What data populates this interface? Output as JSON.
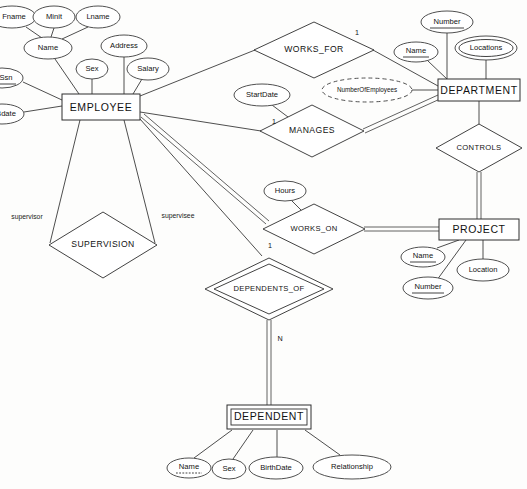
{
  "diagram": {
    "notation": "Chen",
    "background_color": "#fdfdfc",
    "line_color": "#2e2e2e",
    "text_color": "#121212"
  },
  "entities": [
    {
      "id": "employee",
      "label": "EMPLOYEE",
      "weak": false,
      "x": 101,
      "y": 107,
      "w": 78,
      "h": 26
    },
    {
      "id": "department",
      "label": "DEPARTMENT",
      "weak": false,
      "x": 479,
      "y": 90,
      "w": 82,
      "h": 22
    },
    {
      "id": "project",
      "label": "PROJECT",
      "weak": false,
      "x": 479,
      "y": 229,
      "w": 80,
      "h": 21
    },
    {
      "id": "dependent",
      "label": "DEPENDENT",
      "weak": true,
      "x": 269,
      "y": 417,
      "w": 84,
      "h": 24
    }
  ],
  "relationships": [
    {
      "id": "works_for",
      "label": "WORKS_FOR",
      "identifying": false,
      "x": 314,
      "y": 50,
      "rx": 60,
      "ry": 28
    },
    {
      "id": "manages",
      "label": "MANAGES",
      "identifying": false,
      "x": 312,
      "y": 131,
      "rx": 52,
      "ry": 26
    },
    {
      "id": "controls",
      "label": "CONTROLS",
      "identifying": false,
      "x": 479,
      "y": 148,
      "rx": 43,
      "ry": 24
    },
    {
      "id": "works_on",
      "label": "WORKS_ON",
      "identifying": false,
      "x": 314,
      "y": 229,
      "rx": 51,
      "ry": 25
    },
    {
      "id": "supervision",
      "label": "SUPERVISION",
      "identifying": false,
      "x": 103,
      "y": 245,
      "rx": 54,
      "ry": 33
    },
    {
      "id": "dependents_of",
      "label": "DEPENDENTS_OF",
      "identifying": true,
      "x": 269,
      "y": 289,
      "rx": 64,
      "ry": 31
    }
  ],
  "attributes": [
    {
      "id": "emp-fname",
      "label": "Fname",
      "owner": "employee",
      "kind": "simple",
      "x": 12,
      "y": 17,
      "rx": 24,
      "ry": 11
    },
    {
      "id": "emp-minit",
      "label": "Minit",
      "owner": "employee",
      "kind": "simple",
      "x": 54,
      "y": 17,
      "rx": 21,
      "ry": 11
    },
    {
      "id": "emp-lname",
      "label": "Lname",
      "owner": "employee",
      "kind": "simple",
      "x": 98,
      "y": 17,
      "rx": 22,
      "ry": 11
    },
    {
      "id": "emp-name",
      "label": "Name",
      "owner": "employee",
      "kind": "composite",
      "x": 48,
      "y": 48,
      "rx": 24,
      "ry": 11
    },
    {
      "id": "emp-address",
      "label": "Address",
      "owner": "employee",
      "kind": "simple",
      "x": 124,
      "y": 46,
      "rx": 23,
      "ry": 11
    },
    {
      "id": "emp-sex",
      "label": "Sex",
      "owner": "employee",
      "kind": "simple",
      "x": 92,
      "y": 69,
      "rx": 16,
      "ry": 10
    },
    {
      "id": "emp-salary",
      "label": "Salary",
      "owner": "employee",
      "kind": "simple",
      "x": 148,
      "y": 69,
      "rx": 21,
      "ry": 11
    },
    {
      "id": "emp-ssn",
      "label": "Ssn",
      "owner": "employee",
      "kind": "key",
      "x": 2,
      "y": 78,
      "rx": 21,
      "ry": 10
    },
    {
      "id": "emp-bdate",
      "label": "Bdate",
      "owner": "employee",
      "kind": "simple",
      "x": 2,
      "y": 114,
      "rx": 22,
      "ry": 10
    },
    {
      "id": "dept-number",
      "label": "Number",
      "owner": "department",
      "kind": "key",
      "x": 447,
      "y": 22,
      "rx": 26,
      "ry": 11
    },
    {
      "id": "dept-name",
      "label": "Name",
      "owner": "department",
      "kind": "key",
      "x": 416,
      "y": 52,
      "rx": 22,
      "ry": 10
    },
    {
      "id": "dept-locations",
      "label": "Locations",
      "owner": "department",
      "kind": "multivalued",
      "x": 486,
      "y": 48,
      "rx": 31,
      "ry": 12
    },
    {
      "id": "dept-numemp",
      "label": "NumberOfEmployees",
      "owner": "department",
      "kind": "derived",
      "x": 367,
      "y": 90,
      "rx": 45,
      "ry": 12
    },
    {
      "id": "manages-start",
      "label": "StartDate",
      "owner": "manages",
      "kind": "simple",
      "x": 262,
      "y": 95,
      "rx": 28,
      "ry": 11
    },
    {
      "id": "workson-hours",
      "label": "Hours",
      "owner": "works_on",
      "kind": "simple",
      "x": 285,
      "y": 191,
      "rx": 21,
      "ry": 10
    },
    {
      "id": "proj-name",
      "label": "Name",
      "owner": "project",
      "kind": "key",
      "x": 423,
      "y": 257,
      "rx": 22,
      "ry": 10
    },
    {
      "id": "proj-location",
      "label": "Location",
      "owner": "project",
      "kind": "simple",
      "x": 483,
      "y": 270,
      "rx": 26,
      "ry": 11
    },
    {
      "id": "proj-number",
      "label": "Number",
      "owner": "project",
      "kind": "key",
      "x": 428,
      "y": 288,
      "rx": 25,
      "ry": 11
    },
    {
      "id": "dep-name",
      "label": "Name",
      "owner": "dependent",
      "kind": "partialkey",
      "x": 189,
      "y": 468,
      "rx": 22,
      "ry": 10
    },
    {
      "id": "dep-sex",
      "label": "Sex",
      "owner": "dependent",
      "kind": "simple",
      "x": 229,
      "y": 469,
      "rx": 17,
      "ry": 10
    },
    {
      "id": "dep-birthdate",
      "label": "BirthDate",
      "owner": "dependent",
      "kind": "simple",
      "x": 276,
      "y": 468,
      "rx": 27,
      "ry": 11
    },
    {
      "id": "dep-relationship",
      "label": "Relationship",
      "owner": "dependent",
      "kind": "simple",
      "x": 352,
      "y": 467,
      "rx": 39,
      "ry": 12
    }
  ],
  "cardinality_labels": [
    {
      "id": "card-works-for",
      "text": "1",
      "x": 357,
      "y": 33
    },
    {
      "id": "card-manages",
      "text": "1",
      "x": 274,
      "y": 122
    },
    {
      "id": "card-dependents-1",
      "text": "1",
      "x": 270,
      "y": 246
    },
    {
      "id": "card-dependents-n",
      "text": "N",
      "x": 280,
      "y": 339
    }
  ],
  "role_labels": [
    {
      "id": "role-supervisor",
      "text": "supervisor",
      "x": 27,
      "y": 217
    },
    {
      "id": "role-supervisee",
      "text": "supervisee",
      "x": 178,
      "y": 216
    }
  ]
}
